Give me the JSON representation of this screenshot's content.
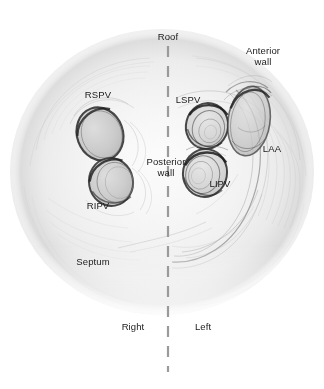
{
  "figure": {
    "title_visible": false,
    "view": "Left atrium endocardial view",
    "background_color": "#ffffff",
    "ink_color": "#1a1a1a",
    "shading_color": "#8c8c8c",
    "midline": {
      "style": "dashed",
      "color": "#9a9a9a",
      "x": 168,
      "y_start": 46,
      "y_end": 372
    },
    "cavity": {
      "shape": "circle",
      "center_x": 162,
      "center_y": 172,
      "radius_x": 152,
      "radius_y": 143,
      "fill": "#f2f2f2"
    }
  },
  "labels": [
    {
      "id": "roof",
      "text": "Roof",
      "x": 168,
      "y": 36,
      "align": "center"
    },
    {
      "id": "anterior_wall",
      "text": "Anterior\nwall",
      "x": 263,
      "y": 50,
      "align": "center"
    },
    {
      "id": "rspv",
      "text": "RSPV",
      "x": 98,
      "y": 94,
      "align": "center"
    },
    {
      "id": "lspv",
      "text": "LSPV",
      "x": 188,
      "y": 99,
      "align": "center"
    },
    {
      "id": "laa",
      "text": "LAA",
      "x": 272,
      "y": 148,
      "align": "center"
    },
    {
      "id": "posterior_wall",
      "text": "Posterior\nwall",
      "x": 166,
      "y": 161,
      "align": "center"
    },
    {
      "id": "lipv",
      "text": "LIPV",
      "x": 220,
      "y": 183,
      "align": "center"
    },
    {
      "id": "ripv",
      "text": "RIPV",
      "x": 98,
      "y": 205,
      "align": "center"
    },
    {
      "id": "septum",
      "text": "Septum",
      "x": 93,
      "y": 261,
      "align": "center"
    },
    {
      "id": "right",
      "text": "Right",
      "x": 133,
      "y": 326,
      "align": "center"
    },
    {
      "id": "left",
      "text": "Left",
      "x": 203,
      "y": 326,
      "align": "center"
    }
  ],
  "structures": [
    {
      "id": "rspv_ostium",
      "name": "RSPV",
      "full_name": "Right superior pulmonary vein ostium",
      "cx": 100,
      "cy": 134,
      "rx": 23,
      "ry": 27,
      "rotation": -20
    },
    {
      "id": "ripv_ostium",
      "name": "RIPV",
      "full_name": "Right inferior pulmonary vein ostium",
      "cx": 111,
      "cy": 182,
      "rx": 22,
      "ry": 24,
      "rotation": -10
    },
    {
      "id": "lspv_ostium",
      "name": "LSPV",
      "full_name": "Left superior pulmonary vein ostium",
      "cx": 207,
      "cy": 126,
      "rx": 21,
      "ry": 23,
      "rotation": 15
    },
    {
      "id": "lipv_ostium",
      "name": "LIPV",
      "full_name": "Left inferior pulmonary vein ostium",
      "cx": 205,
      "cy": 173,
      "rx": 22,
      "ry": 24,
      "rotation": 10
    },
    {
      "id": "laa_orifice",
      "name": "LAA",
      "full_name": "Left atrial appendage orifice",
      "cx": 249,
      "cy": 121,
      "rx": 21,
      "ry": 35,
      "rotation": 8
    }
  ]
}
